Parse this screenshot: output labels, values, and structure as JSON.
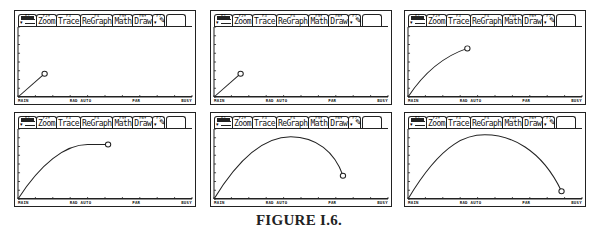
{
  "toolbar": {
    "tabs": [
      {
        "fkey": "F1",
        "label": ""
      },
      {
        "fkey": "F2▾",
        "label": "Zoom"
      },
      {
        "fkey": "F3",
        "label": "Trace"
      },
      {
        "fkey": "F4",
        "label": "ReGraph"
      },
      {
        "fkey": "F5▾",
        "label": "Math"
      },
      {
        "fkey": "F6▾",
        "label": "Draw"
      },
      {
        "fkey": "F7",
        "label": ""
      }
    ],
    "icons": {
      "tools": "tools-icon",
      "pencil": "pencil-icon",
      "dropdown": "▾"
    }
  },
  "status_bar": {
    "mode": "MAIN",
    "angle": "RAD AUTO",
    "graph": "PAR",
    "busy": "BUSY"
  },
  "panels": [
    {
      "id": 1,
      "path": "M0,72 L26,48",
      "marker": [
        26,
        48
      ]
    },
    {
      "id": 2,
      "path": "M0,72 L26,48",
      "marker": [
        26,
        48
      ]
    },
    {
      "id": 3,
      "path": "M0,72 C15,48 35,30 58,22",
      "marker": [
        58,
        22
      ]
    },
    {
      "id": 4,
      "path": "M0,72 C22,36 46,16 68,16 L88,16",
      "marker": [
        88,
        16
      ]
    },
    {
      "id": 5,
      "path": "M0,72 C30,20 55,8 75,8 C100,8 118,24 126,48",
      "marker": [
        126,
        48
      ]
    },
    {
      "id": 6,
      "path": "M0,72 C35,10 60,6 75,6 C100,6 130,20 150,64",
      "marker": [
        150,
        64
      ]
    }
  ],
  "caption": "FIGURE I.6."
}
